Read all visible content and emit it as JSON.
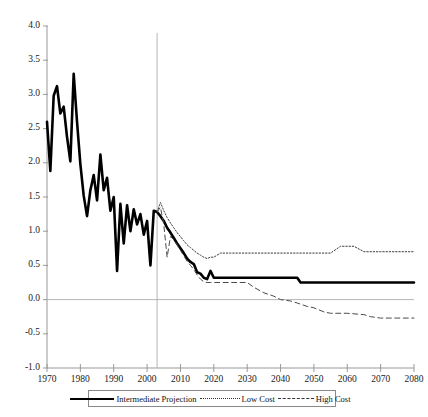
{
  "chart_data": {
    "type": "line",
    "title": "",
    "subtitle": "",
    "xlabel": "",
    "ylabel": "",
    "xlim": [
      1970,
      2080
    ],
    "ylim": [
      -1.0,
      4.0
    ],
    "grid": false,
    "zero_line": true,
    "divider_year": 2003,
    "legend_position": "bottom",
    "x_ticks": [
      1970,
      1980,
      1990,
      2000,
      2010,
      2020,
      2030,
      2040,
      2050,
      2060,
      2070,
      2080
    ],
    "x_tick_labels": [
      "1970",
      "1980",
      "1990",
      "2000",
      "2010",
      "2020",
      "2030",
      "2040",
      "2050",
      "2060",
      "2070",
      "2080"
    ],
    "y_ticks": [
      -1.0,
      -0.5,
      0.0,
      0.5,
      1.0,
      1.5,
      2.0,
      2.5,
      3.0,
      3.5,
      4.0
    ],
    "y_tick_labels": [
      "-1.0",
      "-0.5",
      "0.0",
      "0.5",
      "1.0",
      "1.5",
      "2.0",
      "2.5",
      "3.0",
      "3.5",
      "4.0"
    ],
    "series": [
      {
        "name": "Intermediate Projection",
        "style": "solid",
        "color": "#000000",
        "width": 2.6,
        "x": [
          1970,
          1971,
          1972,
          1973,
          1974,
          1975,
          1976,
          1977,
          1978,
          1979,
          1980,
          1981,
          1982,
          1983,
          1984,
          1985,
          1986,
          1987,
          1988,
          1989,
          1990,
          1991,
          1992,
          1993,
          1994,
          1995,
          1996,
          1997,
          1998,
          1999,
          2000,
          2001,
          2002,
          2003,
          2004,
          2005,
          2006,
          2007,
          2008,
          2009,
          2010,
          2011,
          2012,
          2013,
          2014,
          2015,
          2016,
          2017,
          2018,
          2019,
          2020,
          2025,
          2030,
          2035,
          2040,
          2045,
          2046,
          2050,
          2060,
          2070,
          2080
        ],
        "y": [
          2.6,
          1.88,
          2.98,
          3.12,
          2.72,
          2.82,
          2.38,
          2.02,
          3.3,
          2.6,
          1.98,
          1.52,
          1.22,
          1.6,
          1.82,
          1.45,
          2.12,
          1.6,
          1.78,
          1.3,
          1.5,
          0.42,
          1.4,
          0.82,
          1.38,
          1.0,
          1.32,
          1.1,
          1.25,
          0.95,
          1.15,
          0.5,
          1.3,
          1.28,
          1.22,
          1.15,
          1.05,
          0.98,
          0.9,
          0.82,
          0.75,
          0.68,
          0.6,
          0.55,
          0.52,
          0.4,
          0.38,
          0.32,
          0.3,
          0.42,
          0.32,
          0.32,
          0.32,
          0.32,
          0.32,
          0.32,
          0.25,
          0.25,
          0.25,
          0.25,
          0.25
        ]
      },
      {
        "name": "Low Cost",
        "style": "dotted",
        "color": "#3a3a3a",
        "width": 1.0,
        "x": [
          2003,
          2004,
          2005,
          2006,
          2007,
          2008,
          2009,
          2010,
          2011,
          2012,
          2013,
          2014,
          2015,
          2016,
          2017,
          2018,
          2019,
          2020,
          2022,
          2025,
          2030,
          2035,
          2040,
          2044,
          2045,
          2050,
          2055,
          2058,
          2060,
          2062,
          2065,
          2070,
          2075,
          2080
        ],
        "y": [
          1.28,
          1.42,
          1.3,
          1.2,
          1.12,
          1.05,
          0.98,
          0.92,
          0.86,
          0.8,
          0.76,
          0.72,
          0.68,
          0.65,
          0.62,
          0.6,
          0.62,
          0.62,
          0.68,
          0.68,
          0.68,
          0.68,
          0.68,
          0.68,
          0.68,
          0.68,
          0.68,
          0.78,
          0.78,
          0.78,
          0.7,
          0.7,
          0.7,
          0.7
        ]
      },
      {
        "name": "High Cost",
        "style": "dashed",
        "color": "#4a4a4a",
        "width": 1.0,
        "x": [
          2003,
          2004,
          2005,
          2006,
          2007,
          2008,
          2009,
          2010,
          2011,
          2012,
          2013,
          2014,
          2015,
          2016,
          2017,
          2018,
          2019,
          2020,
          2025,
          2030,
          2032,
          2035,
          2038,
          2040,
          2043,
          2045,
          2048,
          2050,
          2053,
          2055,
          2060,
          2065,
          2067,
          2070,
          2075,
          2080
        ],
        "y": [
          1.28,
          1.35,
          1.1,
          0.62,
          0.92,
          0.88,
          0.8,
          0.72,
          0.64,
          0.56,
          0.5,
          0.44,
          0.36,
          0.3,
          0.26,
          0.25,
          0.25,
          0.25,
          0.25,
          0.25,
          0.18,
          0.1,
          0.05,
          0.0,
          -0.02,
          -0.05,
          -0.1,
          -0.12,
          -0.18,
          -0.2,
          -0.2,
          -0.22,
          -0.25,
          -0.27,
          -0.27,
          -0.27
        ]
      }
    ]
  },
  "legend": {
    "items": [
      {
        "label": "Intermediate Projection",
        "sample": "solid-line-swatch"
      },
      {
        "label": "Low Cost",
        "sample": "dotted-line-swatch"
      },
      {
        "label": "High Cost",
        "sample": "dashed-line-swatch"
      }
    ]
  },
  "colors": {
    "axis": "#999999",
    "intermediate": "#000000",
    "low_cost": "#3a3a3a",
    "high_cost": "#4a4a4a",
    "background": "#ffffff"
  }
}
